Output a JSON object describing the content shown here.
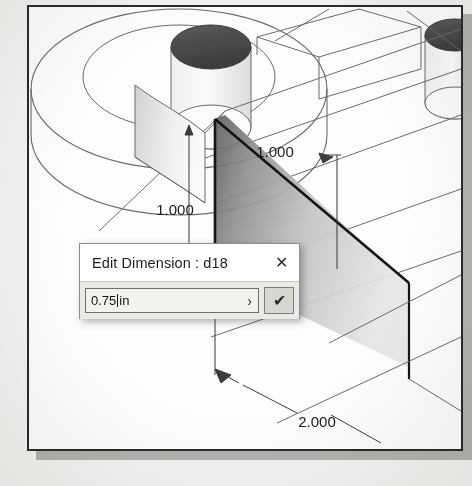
{
  "viewport": {
    "name": "cad-isometric-view",
    "background_hex": "#fdfdfc",
    "border_hex": "#2a2a2a",
    "page_hex": "#f4f3f1",
    "shadow_hex": "#b4b2ae"
  },
  "model": {
    "shaded_face_light_hex": "#6e6e6e",
    "shaded_face_dark_hex": "#d9d9d9",
    "edge_hex": "#5d5d5d",
    "heavy_edge_hex": "#111111",
    "hole_fill_hex": "#4a4a4a"
  },
  "dimensions": [
    {
      "name": "dimension-vertical-left",
      "label": "1.000"
    },
    {
      "name": "dimension-upper-right",
      "label": "1.000"
    },
    {
      "name": "dimension-lower-leader",
      "label": "2.000"
    }
  ],
  "dialog": {
    "title": "Edit Dimension : d18",
    "close_glyph": "✕",
    "close_name": "close-icon",
    "value": "0.75",
    "units": " in",
    "full_value": "0.75 in",
    "placeholder": "0.75 in",
    "expand_glyph": "›",
    "accept_glyph": "✔",
    "accept_color_hex": "#2c2c2c",
    "button_face_hex": "#d8d6d2"
  }
}
